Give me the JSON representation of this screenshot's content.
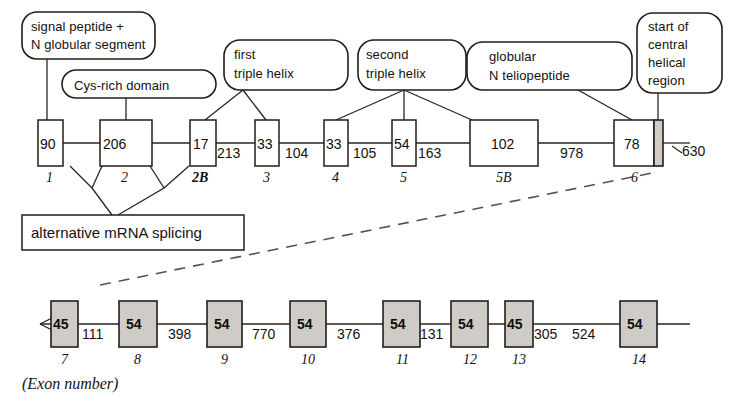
{
  "diagram": {
    "title_caption": "(Exon number)",
    "splice_label": "alternative mRNA splicing",
    "callouts": [
      {
        "id": "signal-peptide",
        "lines": [
          "signal peptide +",
          "N globular segment"
        ],
        "shape": "rounded-rect"
      },
      {
        "id": "cys-rich",
        "lines": [
          "Cys-rich domain"
        ],
        "shape": "oval"
      },
      {
        "id": "first-triple-helix",
        "lines": [
          "first",
          "triple helix"
        ],
        "shape": "rounded-rect"
      },
      {
        "id": "second-triple-helix",
        "lines": [
          "second",
          "triple helix"
        ],
        "shape": "rounded-rect"
      },
      {
        "id": "globular-n-telopeptide",
        "lines": [
          "globular",
          "N teliopeptide"
        ],
        "shape": "rounded-rect"
      },
      {
        "id": "start-central-helical",
        "lines": [
          "start of",
          "central",
          "helical",
          "region"
        ],
        "shape": "rounded-rect"
      }
    ],
    "top_row": {
      "exons": [
        {
          "label": "1",
          "size": "90",
          "bold": false
        },
        {
          "label": "2",
          "size": "206",
          "bold": false
        },
        {
          "label": "2B",
          "size": "17",
          "bold": true
        },
        {
          "label": "3",
          "size": "33",
          "bold": false
        },
        {
          "label": "4",
          "size": "33",
          "bold": false
        },
        {
          "label": "5",
          "size": "54",
          "bold": false
        },
        {
          "label": "5B",
          "size": "102",
          "bold": false
        },
        {
          "label": "6",
          "size": "78",
          "bold": false
        }
      ],
      "introns": [
        "213",
        "104",
        "105",
        "163",
        "978"
      ],
      "tail_value": "630"
    },
    "bottom_row": {
      "exons": [
        {
          "label": "7",
          "size": "45"
        },
        {
          "label": "8",
          "size": "54"
        },
        {
          "label": "9",
          "size": "54"
        },
        {
          "label": "10",
          "size": "54"
        },
        {
          "label": "11",
          "size": "54"
        },
        {
          "label": "12",
          "size": "54"
        },
        {
          "label": "13",
          "size": "45"
        },
        {
          "label": "14",
          "size": "54"
        }
      ],
      "introns": [
        "111",
        "398",
        "770",
        "376",
        "131",
        "305",
        "524"
      ]
    },
    "colors": {
      "ink": "#231d1a",
      "exon_fill": "#cfcbc6",
      "paper": "#ffffff",
      "dash": "#58504c"
    }
  }
}
